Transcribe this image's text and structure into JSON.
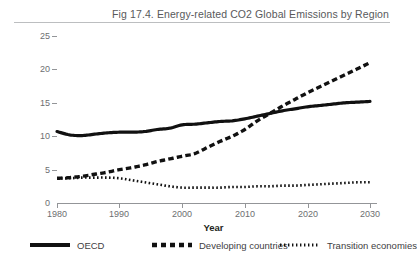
{
  "figure": {
    "title": "Fig 17.4. Energy-related CO2 Global Emissions by Region"
  },
  "chart_data": {
    "type": "line",
    "title": "Fig 17.4. Energy-related CO2 Global Emissions by Region",
    "xlabel": "Year",
    "ylabel": "Billion tones",
    "xlim": [
      1980,
      2030
    ],
    "ylim": [
      0,
      25
    ],
    "xticks": [
      1980,
      1990,
      2000,
      2010,
      2020,
      2030
    ],
    "yticks": [
      0,
      5,
      10,
      15,
      20,
      25
    ],
    "grid": false,
    "legend_position": "bottom",
    "x": [
      1980,
      1982,
      1984,
      1986,
      1988,
      1990,
      1992,
      1994,
      1996,
      1998,
      2000,
      2002,
      2004,
      2006,
      2008,
      2010,
      2012,
      2014,
      2016,
      2018,
      2020,
      2022,
      2024,
      2026,
      2028,
      2030
    ],
    "series": [
      {
        "name": "OECD",
        "style": "solid",
        "color": "#111111",
        "values": [
          10.7,
          10.2,
          10.1,
          10.3,
          10.5,
          10.6,
          10.6,
          10.7,
          11.0,
          11.2,
          11.7,
          11.8,
          12.0,
          12.2,
          12.3,
          12.6,
          13.0,
          13.4,
          13.8,
          14.1,
          14.4,
          14.6,
          14.8,
          15.0,
          15.1,
          15.2
        ]
      },
      {
        "name": "Developing countries",
        "style": "dashed",
        "color": "#111111",
        "values": [
          3.7,
          3.8,
          4.0,
          4.3,
          4.6,
          5.0,
          5.3,
          5.7,
          6.2,
          6.6,
          7.0,
          7.4,
          8.3,
          9.2,
          10.0,
          11.0,
          12.3,
          13.4,
          14.5,
          15.5,
          16.5,
          17.4,
          18.3,
          19.2,
          20.1,
          21.0
        ]
      },
      {
        "name": "Transition economies",
        "style": "dotted",
        "color": "#111111",
        "values": [
          3.7,
          3.7,
          3.8,
          3.8,
          3.8,
          3.7,
          3.4,
          3.1,
          2.8,
          2.5,
          2.3,
          2.3,
          2.3,
          2.3,
          2.4,
          2.4,
          2.5,
          2.5,
          2.6,
          2.6,
          2.7,
          2.8,
          2.9,
          3.0,
          3.1,
          3.1
        ]
      }
    ]
  },
  "axis": {
    "y_ticks": [
      "0",
      "5",
      "10",
      "15",
      "20",
      "25"
    ],
    "x_ticks": [
      "1980",
      "1990",
      "2000",
      "2010",
      "2020",
      "2030"
    ],
    "x_title": "Year",
    "y_title": "Billion tones"
  },
  "legend": {
    "items": [
      {
        "label": "OECD",
        "style": "solid"
      },
      {
        "label": "Developing countries",
        "style": "dashed"
      },
      {
        "label": "Transition economies",
        "style": "dotted"
      }
    ]
  }
}
